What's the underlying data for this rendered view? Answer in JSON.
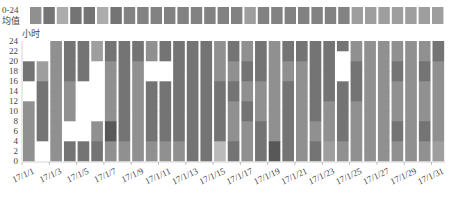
{
  "chart_data": {
    "type": "heatmap",
    "title": "",
    "top_row_label_line1": "0-24",
    "top_row_label_line2": "均值",
    "ylabel": "小时",
    "xlabel": "",
    "ylim": [
      0,
      24
    ],
    "y_ticks": [
      0,
      2,
      4,
      6,
      8,
      10,
      12,
      14,
      16,
      18,
      20,
      22,
      24
    ],
    "x_tick_labels": [
      "17/1/1",
      "17/1/3",
      "17/1/5",
      "17/1/7",
      "17/1/9",
      "17/1/11",
      "17/1/13",
      "17/1/15",
      "17/1/17",
      "17/1/19",
      "17/1/21",
      "17/1/23",
      "17/1/25",
      "17/1/27",
      "17/1/29",
      "17/1/31"
    ],
    "days": [
      "17/1/1",
      "17/1/2",
      "17/1/3",
      "17/1/4",
      "17/1/5",
      "17/1/6",
      "17/1/7",
      "17/1/8",
      "17/1/9",
      "17/1/10",
      "17/1/11",
      "17/1/12",
      "17/1/13",
      "17/1/14",
      "17/1/15",
      "17/1/16",
      "17/1/17",
      "17/1/18",
      "17/1/19",
      "17/1/20",
      "17/1/21",
      "17/1/22",
      "17/1/23",
      "17/1/24",
      "17/1/25",
      "17/1/26",
      "17/1/27",
      "17/1/28",
      "17/1/29",
      "17/1/30",
      "17/1/31"
    ],
    "hour_block_size": 2,
    "value_scale": "0 = no data (white), 1 = lightest gray ... 5 = darkest gray",
    "daily_average": [
      3,
      4,
      2,
      4,
      4,
      2,
      4,
      3.5,
      3.5,
      3.5,
      3.5,
      3.5,
      3.5,
      3.5,
      3.5,
      3.5,
      2.5,
      3.5,
      3.5,
      3.5,
      3.5,
      3.5,
      3.5,
      3.5,
      2.5,
      2.5,
      2.5,
      2.5,
      2.5,
      2.5,
      2.5
    ],
    "hourly_values_by_day": [
      [
        3,
        3,
        3,
        3,
        3,
        3,
        0,
        0,
        4,
        4,
        0,
        0
      ],
      [
        0,
        0,
        4,
        4,
        4,
        4,
        4,
        4,
        2.5,
        2.5,
        0,
        0
      ],
      [
        3,
        3,
        3,
        3,
        3,
        3,
        3,
        3,
        3,
        3,
        3,
        3
      ],
      [
        4,
        4,
        0,
        0,
        3,
        3,
        3,
        3,
        4,
        4,
        4,
        4
      ],
      [
        4,
        4,
        0,
        0,
        0,
        0,
        0,
        0,
        4,
        4,
        4,
        4
      ],
      [
        4,
        4,
        3,
        3,
        0,
        0,
        0,
        0,
        0,
        0,
        2.5,
        2.5
      ],
      [
        3,
        3,
        5,
        5,
        3,
        3,
        3,
        3,
        3,
        3,
        4,
        4
      ],
      [
        3,
        3,
        4,
        4,
        4,
        4,
        4,
        4,
        4,
        4,
        4,
        4
      ],
      [
        3,
        3,
        3,
        3,
        3,
        3,
        3,
        3,
        3,
        3,
        4,
        4
      ],
      [
        3,
        3,
        4,
        4,
        4,
        4,
        4,
        4,
        0,
        0,
        3,
        3
      ],
      [
        3,
        3,
        4,
        4,
        4,
        4,
        4,
        4,
        0,
        0,
        4,
        4
      ],
      [
        3,
        3,
        4,
        4,
        4,
        4,
        4,
        4,
        4,
        4,
        4,
        4
      ],
      [
        4,
        4,
        4,
        4,
        4,
        4,
        4,
        4,
        4,
        4,
        4,
        4
      ],
      [
        4,
        4,
        4,
        4,
        4,
        4,
        4,
        4,
        4,
        4,
        4,
        4
      ],
      [
        1.5,
        1.5,
        4,
        4,
        4,
        4,
        4,
        4,
        3,
        3,
        3,
        3
      ],
      [
        4,
        4,
        3,
        3,
        3,
        3,
        4,
        4,
        3,
        3,
        4,
        4
      ],
      [
        3,
        3,
        3,
        3,
        4,
        4,
        3,
        3,
        4,
        4,
        3,
        3
      ],
      [
        4,
        4,
        4,
        4,
        3,
        3,
        3,
        3,
        4,
        4,
        4,
        4
      ],
      [
        5,
        5,
        3,
        3,
        3,
        3,
        3,
        3,
        3,
        3,
        3,
        3
      ],
      [
        4,
        4,
        4,
        4,
        4,
        4,
        4,
        4,
        3,
        3,
        4,
        4
      ],
      [
        3,
        3,
        3,
        3,
        3,
        3,
        3,
        3,
        3,
        3,
        4,
        4
      ],
      [
        4,
        4,
        3,
        3,
        4,
        4,
        4,
        4,
        4,
        4,
        4,
        4
      ],
      [
        2.5,
        2.5,
        3,
        3,
        3,
        3,
        4,
        4,
        4,
        4,
        4,
        4
      ],
      [
        3,
        3,
        4,
        4,
        4,
        4,
        4,
        4,
        0,
        0,
        0,
        4
      ],
      [
        3,
        3,
        3,
        3,
        3,
        3,
        4,
        4,
        4,
        4,
        3,
        3
      ],
      [
        3,
        3,
        3,
        3,
        3,
        3,
        3,
        3,
        3,
        3,
        3,
        3
      ],
      [
        3,
        3,
        3,
        3,
        3,
        3,
        3,
        3,
        3,
        3,
        3,
        3
      ],
      [
        3,
        3,
        4,
        4,
        3,
        3,
        3,
        3,
        4,
        4,
        3,
        3
      ],
      [
        3,
        3,
        3,
        3,
        3,
        3,
        3,
        3,
        3,
        3,
        3,
        3
      ],
      [
        3,
        3,
        4,
        4,
        3,
        3,
        3,
        3,
        4,
        4,
        3,
        3
      ],
      [
        2.5,
        2.5,
        3,
        3,
        3,
        3,
        3,
        3,
        3,
        3,
        4,
        4
      ]
    ],
    "grid": false,
    "legend": "none"
  }
}
